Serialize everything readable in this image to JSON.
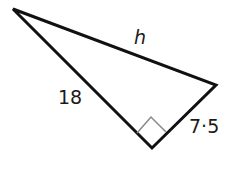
{
  "figure": {
    "type": "right-triangle",
    "vertices": {
      "top_left": [
        13,
        9
      ],
      "right": [
        216,
        85
      ],
      "right_angle": [
        152,
        148
      ]
    },
    "right_angle_marker": true,
    "labels": {
      "hypotenuse": "h",
      "leg_long": "18",
      "leg_short": "7·5"
    },
    "colors": {
      "stroke": "#111111",
      "marker": "#888888",
      "text": "#1a1a1a"
    }
  }
}
